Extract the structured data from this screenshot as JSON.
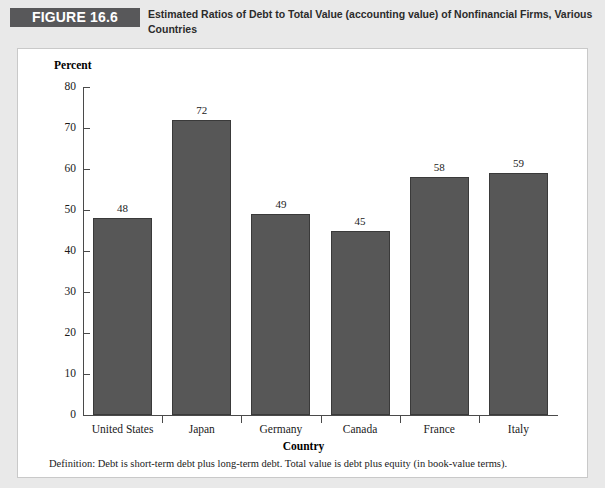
{
  "figure": {
    "tag": "FIGURE 16.6",
    "caption": "Estimated Ratios of Debt to Total Value (accounting value) of Nonfinancial Firms, Various Countries",
    "definition": "Definition: Debt is short-term debt plus long-term debt. Total value is debt plus equity (in book-value terms)."
  },
  "colors": {
    "bar_fill": "#575757",
    "bar_stroke": "#3a3a3a",
    "tag_background": "#58585a",
    "page_background": "#e9e9e9",
    "panel_background": "#ffffff"
  },
  "chart_data": {
    "type": "bar",
    "title": "Estimated Ratios of Debt to Total Value (accounting value) of Nonfinancial Firms, Various Countries",
    "categories": [
      "United States",
      "Japan",
      "Germany",
      "Canada",
      "France",
      "Italy"
    ],
    "values": [
      48,
      72,
      49,
      45,
      58,
      59
    ],
    "data_labels": [
      "48",
      "72",
      "49",
      "45",
      "58",
      "59"
    ],
    "xlabel": "Country",
    "ylabel": "Percent",
    "ylim": [
      0,
      80
    ],
    "yticks": [
      0,
      10,
      20,
      30,
      40,
      50,
      60,
      70,
      80
    ],
    "ytick_labels": [
      "0",
      "10",
      "20",
      "30",
      "40",
      "50",
      "60",
      "70",
      "80"
    ],
    "grid": false,
    "legend": false
  }
}
